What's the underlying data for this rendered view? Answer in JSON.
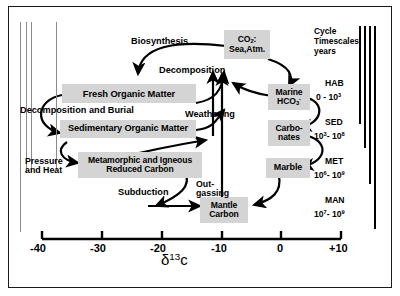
{
  "figure": {
    "title_present": false,
    "background": "#ffffff",
    "box_fill": "#d4d4d4",
    "stroke": "#000000"
  },
  "boxes": [
    {
      "id": "co2",
      "label_html": "CO<sub>2</sub>:<br>Sea,Atm.",
      "label_text": "CO2: Sea,Atm."
    },
    {
      "id": "fresh",
      "label_html": "Fresh  Organic Matter",
      "label_text": "Fresh Organic Matter"
    },
    {
      "id": "sedimentary",
      "label_html": "Sedimentary Organic Matter",
      "label_text": "Sedimentary Organic Matter"
    },
    {
      "id": "metamorphic",
      "label_html": "Metamorphic and Igneous<br>Reduced Carbon",
      "label_text": "Metamorphic and Igneous Reduced Carbon"
    },
    {
      "id": "marine",
      "label_html": "Marine<br>HCO<sub>3</sub><sup>-</sup>",
      "label_text": "Marine HCO3-"
    },
    {
      "id": "carbonates",
      "label_html": "Carbo-<br>nates",
      "label_text": "Carbonates"
    },
    {
      "id": "marble",
      "label_html": "Marble",
      "label_text": "Marble"
    },
    {
      "id": "mantle",
      "label_html": "Mantle<br>Carbon",
      "label_text": "Mantle Carbon"
    }
  ],
  "process_labels": [
    {
      "id": "biosynthesis",
      "text": "Biosynthesis"
    },
    {
      "id": "decomposition",
      "text": "Decomposition"
    },
    {
      "id": "decomp-burial",
      "text": "Decomposition and Burial"
    },
    {
      "id": "weathering",
      "text": "Weathering"
    },
    {
      "id": "pressure-heat",
      "text": "Pressure\nand Heat",
      "line1": "Pressure",
      "line2": "and Heat"
    },
    {
      "id": "subduction",
      "text": "Subduction"
    },
    {
      "id": "outgassing",
      "text": "Out-\ngassing",
      "line1": "Out-",
      "line2": "gassing"
    }
  ],
  "axis": {
    "title_html": "&delta;<sup>13</sup>c",
    "title_text": "δ13c",
    "ticks": [
      "-40",
      "-30",
      "-20",
      "-10",
      "0",
      "+10"
    ],
    "values": [
      -40,
      -30,
      -20,
      -10,
      0,
      10
    ],
    "min": -40,
    "max": 10
  },
  "timescales": {
    "header_line1": "Cycle",
    "header_line2": "Timescales,",
    "header_line3": "years",
    "entries": [
      {
        "name": "HAB",
        "range_html": "0 - 10<sup>3</sup>",
        "range_text": "0 - 10^3"
      },
      {
        "name": "SED",
        "range_html": "10<sup>3</sup>- 10<sup>8</sup>",
        "range_text": "10^3 - 10^8"
      },
      {
        "name": "MET",
        "range_html": "10<sup>6</sup>- 10<sup>9</sup>",
        "range_text": "10^6 - 10^9"
      },
      {
        "name": "MAN",
        "range_html": "10<sup>7</sup>- 10<sup>9</sup>",
        "range_text": "10^7 - 10^9"
      }
    ]
  },
  "chart_data": {
    "type": "diagram",
    "xlabel": "δ13c",
    "xlim": [
      -40,
      10
    ],
    "xticks": [
      -40,
      -30,
      -20,
      -10,
      0,
      10
    ],
    "nodes": [
      {
        "name": "CO2: Sea,Atm.",
        "d13c_center": -7,
        "timescale": "HAB"
      },
      {
        "name": "Fresh Organic Matter",
        "d13c_center": -26,
        "timescale": "HAB"
      },
      {
        "name": "Sedimentary Organic Matter",
        "d13c_center": -26,
        "timescale": "SED"
      },
      {
        "name": "Metamorphic and Igneous Reduced Carbon",
        "d13c_center": -24,
        "timescale": "MET"
      },
      {
        "name": "Marine HCO3-",
        "d13c_center": -1,
        "timescale": "HAB"
      },
      {
        "name": "Carbonates",
        "d13c_center": -1,
        "timescale": "SED"
      },
      {
        "name": "Marble",
        "d13c_center": -1,
        "timescale": "MET"
      },
      {
        "name": "Mantle Carbon",
        "d13c_center": -6,
        "timescale": "MAN"
      }
    ],
    "edges": [
      {
        "from": "CO2: Sea,Atm.",
        "to": "Fresh Organic Matter",
        "label": "Biosynthesis"
      },
      {
        "from": "Fresh Organic Matter",
        "to": "CO2: Sea,Atm.",
        "label": "Decomposition"
      },
      {
        "from": "Fresh Organic Matter",
        "to": "Sedimentary Organic Matter",
        "label": "Decomposition and Burial"
      },
      {
        "from": "Sedimentary Organic Matter",
        "to": "CO2: Sea,Atm.",
        "label": "Weathering"
      },
      {
        "from": "Sedimentary Organic Matter",
        "to": "Metamorphic and Igneous Reduced Carbon",
        "label": "Pressure and Heat"
      },
      {
        "from": "Metamorphic and Igneous Reduced Carbon",
        "to": "Mantle Carbon",
        "label": "Subduction"
      },
      {
        "from": "Mantle Carbon",
        "to": "CO2: Sea,Atm.",
        "label": "Out-gassing"
      },
      {
        "from": "CO2: Sea,Atm.",
        "to": "Marine HCO3-",
        "label": ""
      },
      {
        "from": "Marine HCO3-",
        "to": "Carbonates",
        "label": ""
      },
      {
        "from": "Carbonates",
        "to": "Marble",
        "label": ""
      },
      {
        "from": "Marble",
        "to": "Mantle Carbon",
        "label": ""
      },
      {
        "from": "Carbonates",
        "to": "CO2: Sea,Atm.",
        "label": "Weathering"
      }
    ]
  }
}
